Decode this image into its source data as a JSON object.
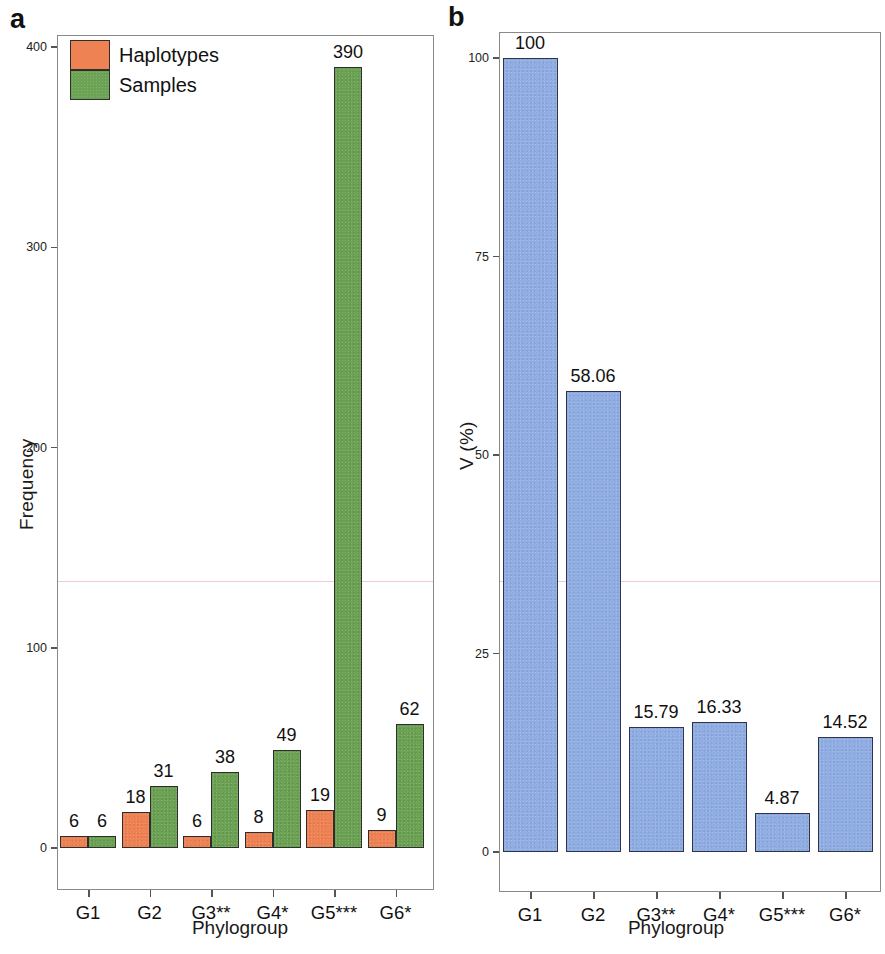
{
  "figure": {
    "panel_a_letter": "a",
    "panel_b_letter": "b"
  },
  "panel_a": {
    "legend": {
      "haplotypes_label": "Haplotypes",
      "samples_label": "Samples",
      "haplotypes_color": "#ef8253",
      "samples_color": "#6ca253"
    },
    "ylabel": "Frequency",
    "xlabel": "Phylogroup",
    "yticks": [
      "0",
      "100",
      "200",
      "300",
      "400"
    ]
  },
  "panel_b": {
    "ylabel": "V (%)",
    "xlabel": "Phylogroup",
    "yticks": [
      "0",
      "25",
      "50",
      "75",
      "100"
    ],
    "bar_color": "#90aee4"
  },
  "chart_data": [
    {
      "type": "bar",
      "title": "a",
      "categories": [
        "G1",
        "G2",
        "G3**",
        "G4*",
        "G5***",
        "G6*"
      ],
      "series": [
        {
          "name": "Haplotypes",
          "values": [
            6,
            18,
            6,
            8,
            19,
            9
          ],
          "color": "#ef8253"
        },
        {
          "name": "Samples",
          "values": [
            6,
            31,
            38,
            49,
            390,
            62
          ],
          "color": "#6ca253"
        }
      ],
      "xlabel": "Phylogroup",
      "ylabel": "Frequency",
      "ylim": [
        0,
        400
      ],
      "yticks": [
        0,
        100,
        200,
        300,
        400
      ],
      "grid": false,
      "legend_position": "top-left",
      "data_labels": true
    },
    {
      "type": "bar",
      "title": "b",
      "categories": [
        "G1",
        "G2",
        "G3**",
        "G4*",
        "G5***",
        "G6*"
      ],
      "values": [
        100,
        58.06,
        15.79,
        16.33,
        4.87,
        14.52
      ],
      "value_labels": [
        "100",
        "58.06",
        "15.79",
        "16.33",
        "4.87",
        "14.52"
      ],
      "color": "#90aee4",
      "xlabel": "Phylogroup",
      "ylabel": "V (%)",
      "ylim": [
        0,
        100
      ],
      "yticks": [
        0,
        25,
        50,
        75,
        100
      ],
      "grid": false,
      "legend_position": "none",
      "data_labels": true
    }
  ]
}
